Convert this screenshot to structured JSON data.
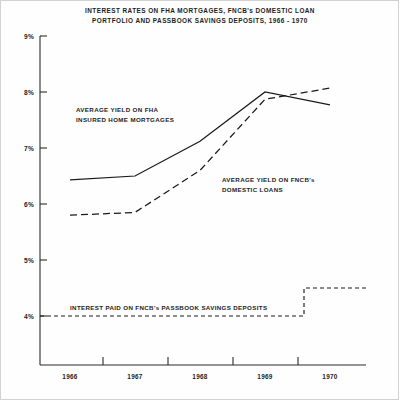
{
  "chart_data": {
    "type": "line",
    "title": "INTEREST RATES ON FHA MORTGAGES, FNCB's DOMESTIC LOAN PORTFOLIO AND PASSBOOK SAVINGS DEPOSITS, 1966 - 1970",
    "title_line1": "INTEREST RATES ON FHA MORTGAGES, FNCB's DOMESTIC LOAN",
    "title_line2": "PORTFOLIO AND PASSBOOK SAVINGS DEPOSITS, 1966 - 1970",
    "xlabel": "",
    "ylabel": "",
    "x": [
      1966,
      1967,
      1968,
      1969,
      1970
    ],
    "categories": [
      "1966",
      "1967",
      "1968",
      "1969",
      "1970"
    ],
    "ylim": [
      3.5,
      9.0
    ],
    "xlim": [
      1965.7,
      1970.6
    ],
    "yticks": [
      4,
      5,
      6,
      7,
      8,
      9
    ],
    "ytick_labels": [
      "4%",
      "5%",
      "6%",
      "7%",
      "8%",
      "9%"
    ],
    "xtick_labels": [
      "1966",
      "1967",
      "1968",
      "1969",
      "1970"
    ],
    "grid": false,
    "legend": "annotations",
    "series": [
      {
        "name": "AVERAGE YIELD ON FHA INSURED HOME MORTGAGES",
        "style": "solid",
        "values": [
          6.43,
          6.5,
          7.12,
          8.0,
          7.77
        ]
      },
      {
        "name": "AVERAGE YIELD ON FNCB's DOMESTIC LOANS",
        "style": "dashed",
        "values": [
          5.8,
          5.85,
          6.6,
          7.87,
          8.07
        ]
      },
      {
        "name": "INTEREST PAID ON FNCB's PASSBOOK SAVINGS DEPOSITS",
        "style": "step-dashed",
        "values": [
          4.0,
          4.0,
          4.0,
          4.0,
          4.5
        ],
        "step_at_x": 1969.6,
        "step_from": 4.0,
        "step_to": 4.5
      }
    ],
    "annotations": [
      {
        "id": "fha",
        "line1": "AVERAGE YIELD ON FHA",
        "line2": "INSURED HOME MORTGAGES"
      },
      {
        "id": "fncb",
        "line1": "AVERAGE YIELD ON FNCB's",
        "line2": "DOMESTIC LOANS"
      },
      {
        "id": "passbook",
        "line1": "INTEREST PAID ON FNCB's PASSBOOK SAVINGS DEPOSITS"
      }
    ],
    "colors": {
      "line": "#1a1a1a",
      "axis": "#2a2a2a",
      "background": "#ffffff",
      "border": "#d2d2d2"
    }
  }
}
